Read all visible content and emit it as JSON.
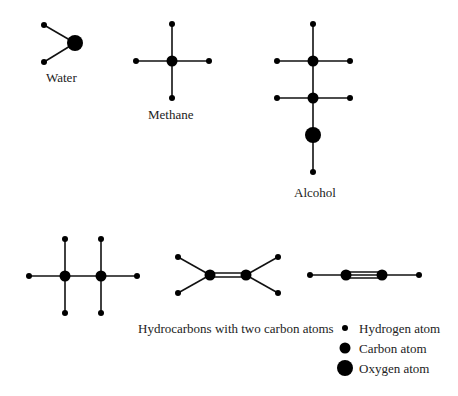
{
  "labels": {
    "water": "Water",
    "methane": "Methane",
    "alcohol": "Alcohol",
    "hydrocarbons": "Hydrocarbons with two carbon atoms"
  },
  "legend": {
    "hydrogen": "Hydrogen atom",
    "carbon": "Carbon atom",
    "oxygen": "Oxygen atom"
  },
  "colors": {
    "atom": "#000000",
    "bond": "#111111",
    "text": "#222222"
  }
}
